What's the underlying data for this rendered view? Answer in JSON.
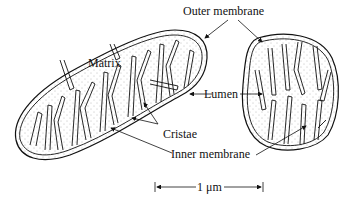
{
  "labels": {
    "outer_membrane": "Outer membrane",
    "matrix": "Matrix",
    "lumen": "Lumen",
    "cristae": "Cristae",
    "inner_membrane": "Inner membrane",
    "scale_bar": "1 μm"
  },
  "colors": {
    "line": "#111111",
    "background": "#ffffff",
    "stipple": "#888888"
  }
}
